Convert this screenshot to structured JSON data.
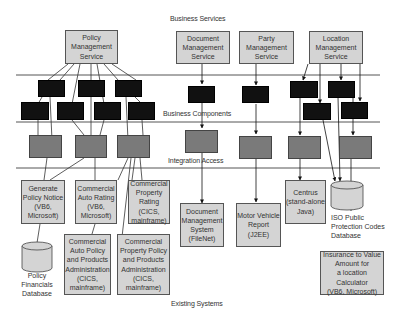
{
  "layers": {
    "business_services": "Business Services",
    "business_components": "Business Components",
    "integration_access": "Integration Access",
    "existing_systems": "Existing Systems"
  },
  "services": [
    {
      "id": "policy",
      "label": "Policy\nManagement\nService"
    },
    {
      "id": "document",
      "label": "Document\nManagement\nService"
    },
    {
      "id": "party",
      "label": "Party\nManagement\nService"
    },
    {
      "id": "location",
      "label": "Location\nManagement\nService"
    }
  ],
  "systems": [
    {
      "id": "generate-policy-notice",
      "label": "Generate\nPolicy Notice\n(VB6,\nMicrosoft)"
    },
    {
      "id": "commercial-auto-rating",
      "label": "Commercial\nAuto Rating\n(VB6,\nMicrosoft)"
    },
    {
      "id": "commercial-property-rating",
      "label": "Commercial\nProperty\nRating (CICS,\nmainframe)"
    },
    {
      "id": "commercial-auto-policy-admin",
      "label": "Commercial\nAuto Policy\nand Products\nAdministration\n(CICS,\nmainframe)"
    },
    {
      "id": "commercial-property-policy-admin",
      "label": "Commercial\nProperty Policy\nand Products\nAdministration\n(CICS,\nmainframe)"
    },
    {
      "id": "document-management-system",
      "label": "Document\nManagement\nSystem\n(FileNet)"
    },
    {
      "id": "motor-vehicle-report",
      "label": "Motor Vehicle\nReport (J2EE)"
    },
    {
      "id": "centrus",
      "label": "Centrus\n(stand-alone\nJava)"
    },
    {
      "id": "insurance-to-value",
      "label": "Insurance to Value\nAmount for\na location Calculator\n(VB6, Microsoft)"
    }
  ],
  "databases": [
    {
      "id": "policy-financials",
      "label": "Policy Financials\nDatabase"
    },
    {
      "id": "iso-public-protection",
      "label": "ISO Public\nProtection Codes\nDatabase"
    }
  ],
  "colors": {
    "service_fill": "#d4d4d4",
    "component_fill": "#111111",
    "integration_fill": "#7a7a7a",
    "line": "#333333"
  }
}
